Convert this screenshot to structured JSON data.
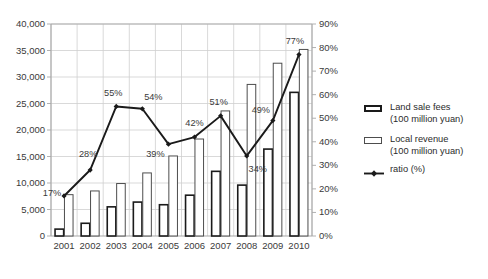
{
  "chart_data": {
    "type": "bar",
    "title": "",
    "subtitle": "",
    "xlabel": "",
    "ylabel": "",
    "y2label": "",
    "categories": [
      "2001",
      "2002",
      "2003",
      "2004",
      "2005",
      "2006",
      "2007",
      "2008",
      "2009",
      "2010"
    ],
    "ylim": [
      0,
      40000
    ],
    "y2lim": [
      0,
      90
    ],
    "yticks": [
      "0",
      "5,000",
      "10,000",
      "15,000",
      "20,000",
      "25,000",
      "30,000",
      "35,000",
      "40,000"
    ],
    "ytick_values": [
      0,
      5000,
      10000,
      15000,
      20000,
      25000,
      30000,
      35000,
      40000
    ],
    "y2ticks": [
      "0%",
      "10%",
      "20%",
      "30%",
      "40%",
      "50%",
      "60%",
      "70%",
      "80%",
      "90%"
    ],
    "y2tick_values": [
      0,
      10,
      20,
      30,
      40,
      50,
      60,
      70,
      80,
      90
    ],
    "grid": true,
    "legend_position": "right",
    "series": [
      {
        "name": "Land sale fees",
        "unit": "(100 million yuan)",
        "type": "bar",
        "axis": "left",
        "values": [
          1300,
          2400,
          5500,
          6400,
          5900,
          7700,
          12200,
          9600,
          16400,
          27100
        ]
      },
      {
        "name": "Local revenue",
        "unit": "(100 million yuan)",
        "type": "bar",
        "axis": "left",
        "values": [
          7800,
          8500,
          9900,
          11900,
          15100,
          18300,
          23600,
          28600,
          32600,
          35200
        ]
      },
      {
        "name": "ratio (%)",
        "unit": "",
        "type": "line",
        "axis": "right",
        "values": [
          17,
          28,
          55,
          54,
          39,
          42,
          51,
          34,
          49,
          77
        ],
        "data_labels": [
          "17%",
          "28%",
          "55%",
          "54%",
          "39%",
          "42%",
          "51%",
          "34%",
          "49%",
          "77%"
        ]
      }
    ]
  },
  "legend": {
    "items": [
      {
        "label": "Land sale fees",
        "sublabel": "(100 million yuan)",
        "marker": "bar-swatch-thick"
      },
      {
        "label": "Local revenue",
        "sublabel": "(100 million yuan)",
        "marker": "bar-swatch-thin"
      },
      {
        "label": "ratio (%)",
        "sublabel": "",
        "marker": "line-marker"
      }
    ]
  },
  "colors": {
    "bar_fill": "#ffffff",
    "bar_stroke_series1": "#1a1a1a",
    "bar_stroke_series2": "#4d4d4d",
    "line_stroke": "#1a1a1a",
    "grid": "#cfcfcf",
    "axis": "#a8a8a8",
    "text": "#2b2b2b",
    "background": "#ffffff"
  }
}
